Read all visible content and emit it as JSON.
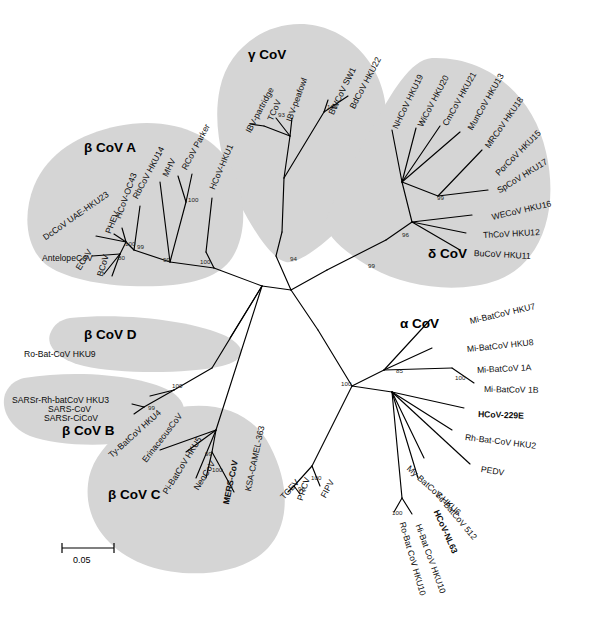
{
  "figure": {
    "type": "phylogenetic-tree",
    "title": "",
    "scale_bar": {
      "label": "0.05",
      "value": 0.05,
      "x": 60,
      "y": 545,
      "width": 52
    }
  },
  "shading_color": "#d5d5d5",
  "clade_labels": [
    {
      "name": "gamma-cov",
      "text": "γ CoV",
      "x": 248,
      "y": 47
    },
    {
      "name": "delta-cov",
      "text": "δ CoV",
      "x": 428,
      "y": 246
    },
    {
      "name": "beta-cov-a",
      "text": "β CoV A",
      "x": 84,
      "y": 140
    },
    {
      "name": "beta-cov-d",
      "text": "β CoV D",
      "x": 84,
      "y": 327
    },
    {
      "name": "beta-cov-b",
      "text": "β CoV B",
      "x": 62,
      "y": 423
    },
    {
      "name": "beta-cov-c",
      "text": "β CoV C",
      "x": 108,
      "y": 487
    },
    {
      "name": "alpha-cov",
      "text": "α CoV",
      "x": 400,
      "y": 316
    }
  ],
  "taxa": [
    {
      "name": "ibv-partridge",
      "text": "IBV-partridge",
      "x": 248,
      "y": 128,
      "rot": -62,
      "bold": false,
      "clade": "gamma"
    },
    {
      "name": "tcov",
      "text": "TCoV",
      "x": 270,
      "y": 116,
      "rot": -66,
      "bold": false,
      "clade": "gamma"
    },
    {
      "name": "ibv-peafowl",
      "text": "IBV-peafowl",
      "x": 289,
      "y": 117,
      "rot": -70,
      "bold": false,
      "clade": "gamma"
    },
    {
      "name": "bwcov-sw1",
      "text": "BWCoV SW1",
      "x": 331,
      "y": 110,
      "rot": -64,
      "bold": false,
      "clade": "gamma"
    },
    {
      "name": "bdcov-hku22",
      "text": "BdCoV HKU22",
      "x": 352,
      "y": 104,
      "rot": -62,
      "bold": false,
      "clade": "gamma"
    },
    {
      "name": "nhcov-hku19",
      "text": "NHCoV HKU19",
      "x": 395,
      "y": 124,
      "rot": -64,
      "bold": false,
      "clade": "delta"
    },
    {
      "name": "wicov-hku20",
      "text": "WiCoV HKU20",
      "x": 420,
      "y": 122,
      "rot": -62,
      "bold": false,
      "clade": "delta"
    },
    {
      "name": "cmcov-hku21",
      "text": "CmCoV HKU21",
      "x": 445,
      "y": 121,
      "rot": -61,
      "bold": false,
      "clade": "delta"
    },
    {
      "name": "muncov-hku13",
      "text": "MunCoV HKU13",
      "x": 470,
      "y": 125,
      "rot": -60,
      "bold": false,
      "clade": "delta"
    },
    {
      "name": "mrcov-hku18",
      "text": "MRCoV HKU18",
      "x": 487,
      "y": 143,
      "rot": -55,
      "bold": false,
      "clade": "delta"
    },
    {
      "name": "porcov-hku15",
      "text": "PorCoV HKU15",
      "x": 497,
      "y": 170,
      "rot": -45,
      "bold": false,
      "clade": "delta"
    },
    {
      "name": "spcov-hku17",
      "text": "SpCoV HKU17",
      "x": 498,
      "y": 187,
      "rot": -32,
      "bold": false,
      "clade": "delta"
    },
    {
      "name": "wecov-hku16",
      "text": "WECoV HKU16",
      "x": 492,
      "y": 213,
      "rot": -13,
      "bold": false,
      "clade": "delta"
    },
    {
      "name": "thcov-hku12",
      "text": "ThCoV HKU12",
      "x": 483,
      "y": 231,
      "rot": -3,
      "bold": false,
      "clade": "delta"
    },
    {
      "name": "bucov-hku11",
      "text": "BuCoV HKU11",
      "x": 474,
      "y": 249,
      "rot": 3,
      "bold": false,
      "clade": "delta"
    },
    {
      "name": "rbcov-hku14",
      "text": "RbCoV HKU14",
      "x": 135,
      "y": 194,
      "rot": -62,
      "bold": false,
      "clade": "betaA"
    },
    {
      "name": "mhv",
      "text": "MHV",
      "x": 165,
      "y": 172,
      "rot": -64,
      "bold": false,
      "clade": "betaA"
    },
    {
      "name": "rcov-parker",
      "text": "RCoV Parker",
      "x": 184,
      "y": 165,
      "rot": -62,
      "bold": false,
      "clade": "betaA"
    },
    {
      "name": "hcov-hku1",
      "text": "HCoV-HKU1",
      "x": 212,
      "y": 185,
      "rot": -67,
      "bold": false,
      "clade": "betaA"
    },
    {
      "name": "dccov-uae-hku23",
      "text": "DcCoV UAE-HKU23",
      "x": 44,
      "y": 234,
      "rot": -35,
      "bold": false,
      "clade": "betaA"
    },
    {
      "name": "phev",
      "text": "PHEV",
      "x": 108,
      "y": 229,
      "rot": -68,
      "bold": false,
      "clade": "betaA"
    },
    {
      "name": "hcov-oc43",
      "text": "HCoV-OC43",
      "x": 118,
      "y": 214,
      "rot": -70,
      "bold": false,
      "clade": "betaA"
    },
    {
      "name": "antelopecov",
      "text": "AntelopeCoV",
      "x": 42,
      "y": 254,
      "rot": 0,
      "bold": false,
      "clade": "betaA"
    },
    {
      "name": "ecov",
      "text": "ECoV",
      "x": 78,
      "y": 265,
      "rot": -58,
      "bold": false,
      "clade": "betaA"
    },
    {
      "name": "bcov",
      "text": "BCoV",
      "x": 100,
      "y": 272,
      "rot": -74,
      "bold": false,
      "clade": "betaA"
    },
    {
      "name": "ro-bat-cov-hku9",
      "text": "Ro-Bat-CoV HKU9",
      "x": 24,
      "y": 350,
      "rot": 0,
      "bold": false,
      "clade": "betaD"
    },
    {
      "name": "sarsr-rh-batcov-hku3",
      "text": "SARSr-Rh-batCoV HKU3",
      "x": 12,
      "y": 396,
      "rot": 0,
      "bold": false,
      "clade": "betaB"
    },
    {
      "name": "sars-cov",
      "text": "SARS-CoV",
      "x": 48,
      "y": 405,
      "rot": 0,
      "bold": false,
      "clade": "betaB"
    },
    {
      "name": "sarsr-cicov",
      "text": "SARSr-CiCoV",
      "x": 44,
      "y": 414,
      "rot": 0,
      "bold": false,
      "clade": "betaB"
    },
    {
      "name": "ty-batcov-hku4",
      "text": "Ty-BatCoV HKU4",
      "x": 110,
      "y": 452,
      "rot": -42,
      "bold": false,
      "clade": "betaC"
    },
    {
      "name": "erinaceouscov",
      "text": "ErinaceousCoV",
      "x": 144,
      "y": 457,
      "rot": -52,
      "bold": false,
      "clade": "betaC"
    },
    {
      "name": "pi-batcov-hku5",
      "text": "Pi-BatCoV HKU5",
      "x": 165,
      "y": 489,
      "rot": -58,
      "bold": false,
      "clade": "betaC"
    },
    {
      "name": "neocov",
      "text": "NeoCoV",
      "x": 196,
      "y": 485,
      "rot": -58,
      "bold": false,
      "clade": "betaC"
    },
    {
      "name": "mers-cov",
      "text": "MERS-CoV",
      "x": 226,
      "y": 500,
      "rot": -78,
      "bold": true,
      "clade": "betaC"
    },
    {
      "name": "ksa-camel-363",
      "text": "KSA-CAMEL-363",
      "x": 248,
      "y": 487,
      "rot": -78,
      "bold": false,
      "clade": "betaC"
    },
    {
      "name": "tgev",
      "text": "TGEV",
      "x": 282,
      "y": 494,
      "rot": -48,
      "bold": false,
      "clade": "alpha"
    },
    {
      "name": "prcv",
      "text": "PRCV",
      "x": 300,
      "y": 496,
      "rot": -72,
      "bold": false,
      "clade": "alpha"
    },
    {
      "name": "fipv",
      "text": "FIPV",
      "x": 323,
      "y": 493,
      "rot": -62,
      "bold": false,
      "clade": "alpha"
    },
    {
      "name": "mi-batcov-hku7",
      "text": "Mi-BatCoV HKU7",
      "x": 470,
      "y": 317,
      "rot": -13,
      "bold": false,
      "clade": "alpha"
    },
    {
      "name": "mi-batcov-hku8",
      "text": "Mi-BatCoV HKU8",
      "x": 467,
      "y": 345,
      "rot": -6,
      "bold": false,
      "clade": "alpha"
    },
    {
      "name": "mi-batcov-1a",
      "text": "Mi-BatCoV 1A",
      "x": 477,
      "y": 366,
      "rot": -3,
      "bold": false,
      "clade": "alpha"
    },
    {
      "name": "mi-batcov-1b",
      "text": "Mi-BatCoV 1B",
      "x": 484,
      "y": 385,
      "rot": 1,
      "bold": false,
      "clade": "alpha"
    },
    {
      "name": "hcov-229e",
      "text": "HCoV-229E",
      "x": 478,
      "y": 410,
      "rot": 2,
      "bold": true,
      "clade": "alpha"
    },
    {
      "name": "rh-bat-cov-hku2",
      "text": "Rh-Bat-CoV HKU2",
      "x": 465,
      "y": 433,
      "rot": 7,
      "bold": false,
      "clade": "alpha"
    },
    {
      "name": "pedv",
      "text": "PEDV",
      "x": 481,
      "y": 465,
      "rot": 9,
      "bold": false,
      "clade": "alpha"
    },
    {
      "name": "my-batcov-hku6",
      "text": "My-BatCoV HKU6",
      "x": 408,
      "y": 463,
      "rot": 42,
      "bold": false,
      "clade": "alpha"
    },
    {
      "name": "sc-batcov-512",
      "text": "Sc-BatCoV 512",
      "x": 437,
      "y": 489,
      "rot": 50,
      "bold": false,
      "clade": "alpha"
    },
    {
      "name": "hcov-nl63",
      "text": "HCoV-NL63",
      "x": 436,
      "y": 506,
      "rot": 66,
      "bold": true,
      "clade": "alpha"
    },
    {
      "name": "ro-bat-cov-hku10",
      "text": "Ro-Bat CoV HKU10",
      "x": 402,
      "y": 518,
      "rot": 74,
      "bold": false,
      "clade": "alpha"
    },
    {
      "name": "hi-bat-cov-hku10",
      "text": "Hi-Bat CoV HKU10",
      "x": 418,
      "y": 520,
      "rot": 70,
      "bold": false,
      "clade": "alpha"
    }
  ],
  "bootstrap_values": [
    {
      "name": "boot-gamma-inner",
      "text": "93",
      "x": 278,
      "y": 111
    },
    {
      "name": "boot-gamma-bw",
      "text": "100",
      "x": 327,
      "y": 103
    },
    {
      "name": "boot-gamma-root",
      "text": "94",
      "x": 290,
      "y": 255
    },
    {
      "name": "boot-delta-upper",
      "text": "99",
      "x": 437,
      "y": 194
    },
    {
      "name": "boot-delta-root",
      "text": "96",
      "x": 402,
      "y": 231
    },
    {
      "name": "boot-delta-stem",
      "text": "99",
      "x": 368,
      "y": 262
    },
    {
      "name": "boot-betaa-rc",
      "text": "100",
      "x": 188,
      "y": 196
    },
    {
      "name": "boot-betaa-oc43",
      "text": "99",
      "x": 137,
      "y": 243
    },
    {
      "name": "boot-betaa-inner",
      "text": "100",
      "x": 125,
      "y": 240
    },
    {
      "name": "boot-betaa-bc",
      "text": "80",
      "x": 118,
      "y": 254
    },
    {
      "name": "boot-betaa-mid",
      "text": "99",
      "x": 163,
      "y": 256
    },
    {
      "name": "boot-betaa-stem",
      "text": "100",
      "x": 200,
      "y": 258
    },
    {
      "name": "boot-betab-node",
      "text": "100",
      "x": 172,
      "y": 382
    },
    {
      "name": "boot-betab-sars",
      "text": "99",
      "x": 148,
      "y": 404
    },
    {
      "name": "boot-betac-neo",
      "text": "99",
      "x": 205,
      "y": 450
    },
    {
      "name": "boot-betac-mers",
      "text": "100",
      "x": 212,
      "y": 466
    },
    {
      "name": "boot-alpha-root",
      "text": "100",
      "x": 341,
      "y": 380
    },
    {
      "name": "boot-alpha-mi",
      "text": "85",
      "x": 396,
      "y": 367
    },
    {
      "name": "boot-alpha-mi1",
      "text": "100",
      "x": 455,
      "y": 374
    },
    {
      "name": "boot-alpha-tgev",
      "text": "100",
      "x": 311,
      "y": 474
    },
    {
      "name": "boot-alpha-prcv",
      "text": "96",
      "x": 298,
      "y": 485
    },
    {
      "name": "boot-alpha-hku10",
      "text": "100",
      "x": 392,
      "y": 509
    }
  ]
}
